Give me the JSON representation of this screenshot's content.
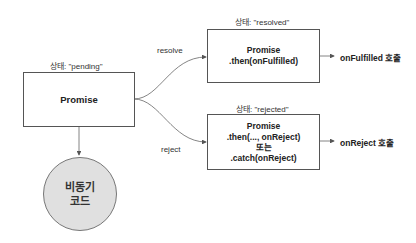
{
  "diagram": {
    "pending": {
      "state_label": "상태: \"pending\"",
      "title": "Promise"
    },
    "resolved": {
      "state_label": "상태: \"resolved\"",
      "lines": [
        "Promise",
        ".then(onFulfilled)"
      ],
      "result": "onFulfilled 호출"
    },
    "rejected": {
      "state_label": "상태: \"rejected\"",
      "lines": [
        "Promise",
        ".then(..., onReject)",
        "또는",
        ".catch(onReject)"
      ],
      "result": "onReject 호출"
    },
    "edges": {
      "resolve": "resolve",
      "reject": "reject"
    },
    "async_code": {
      "lines": [
        "비동기",
        "코드"
      ]
    },
    "colors": {
      "stroke": "#555555",
      "circle_fill": "#e0e0e0"
    }
  }
}
